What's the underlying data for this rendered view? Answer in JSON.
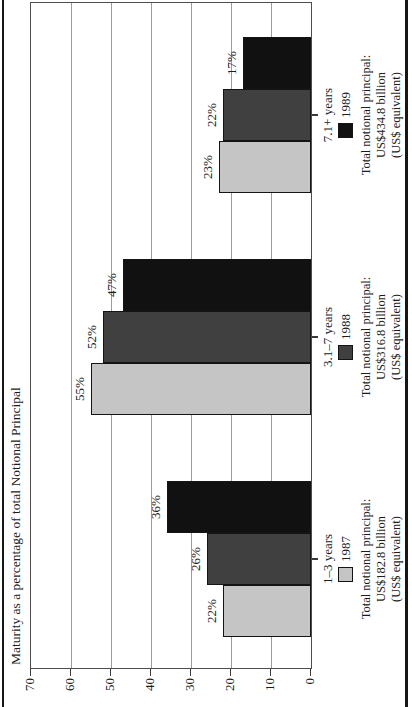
{
  "figure": {
    "title": "Maturity as a percentage of total Notional Principal",
    "orientation": "entire chart printed rotated 90 degrees counterclockwise on the page",
    "colors": {
      "background": "#ffffff",
      "frame_rule": "#161616",
      "plot_border": "#4d4d4d",
      "gridline": "#9b9b9b",
      "tick": "#3a3a3a",
      "text": "#1c1c1c",
      "bar_outline": "#141414"
    }
  },
  "chart_data": {
    "type": "bar",
    "title": "Maturity as a percentage of total Notional Principal",
    "ylabel": "Maturity as a percentage of total Notional Principal",
    "xlabel": "",
    "ylim": [
      0,
      70
    ],
    "yticks": [
      70,
      60,
      50,
      40,
      30,
      20,
      10,
      0
    ],
    "grid": true,
    "value_label_suffix": "%",
    "legend_position": "below each category group",
    "categories": [
      "1–3 years",
      "3.1–7 years",
      "7.1+ years"
    ],
    "series": [
      {
        "name": "1987",
        "color": "#c5c5c5",
        "values": [
          22,
          55,
          23
        ]
      },
      {
        "name": "1988",
        "color": "#404040",
        "values": [
          26,
          52,
          22
        ]
      },
      {
        "name": "1989",
        "color": "#111111",
        "values": [
          36,
          47,
          17
        ]
      }
    ],
    "group_footers": [
      {
        "category": "1–3 years",
        "legend_year": "1987",
        "lines": [
          "Total notional principal:",
          "US$182.8 billion",
          "(US$ equivalent)"
        ]
      },
      {
        "category": "3.1–7 years",
        "legend_year": "1988",
        "lines": [
          "Total notional principal:",
          "US$316.8 billion",
          "(US$ equivalent)"
        ]
      },
      {
        "category": "7.1+ years",
        "legend_year": "1989",
        "lines": [
          "Total notional principal:",
          "US$434.8 billion",
          "(US$ equivalent)"
        ]
      }
    ]
  }
}
